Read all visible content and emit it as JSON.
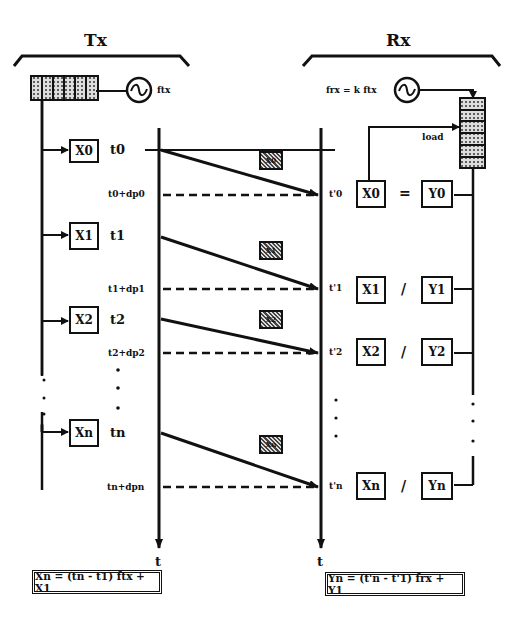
{
  "tx": {
    "title": "Tx",
    "oscillator_label": "ftx",
    "counter_label": "",
    "values": [
      {
        "label": "X0",
        "time": "t0",
        "arrival_label": "t0+dp0"
      },
      {
        "label": "X1",
        "time": "t1",
        "arrival_label": "t1+dp1"
      },
      {
        "label": "X2",
        "time": "t2",
        "arrival_label": "t2+dp2"
      },
      {
        "label": "Xn",
        "time": "tn",
        "arrival_label": "tn+dpn"
      }
    ],
    "axis_label": "t",
    "formula": "Xn = (tn - t1) ftx + X1"
  },
  "rx": {
    "title": "Rx",
    "oscillator_label": "frx = k ftx",
    "load_label": "load",
    "rows": [
      {
        "time": "t'0",
        "x": "X0",
        "relation": "=",
        "y": "Y0"
      },
      {
        "time": "t'1",
        "x": "X1",
        "relation": "/",
        "y": "Y1"
      },
      {
        "time": "t'2",
        "x": "X2",
        "relation": "/",
        "y": "Y2"
      },
      {
        "time": "t'n",
        "x": "Xn",
        "relation": "/",
        "y": "Yn"
      }
    ],
    "axis_label": "t",
    "formula": "Yn = (t'n - t'1) frx + Y1"
  },
  "packets": [
    "X0",
    "X1",
    "X2",
    "Xn"
  ],
  "colors": {
    "ink": "#111111",
    "background": "#ffffff",
    "hatch": "#444444"
  }
}
